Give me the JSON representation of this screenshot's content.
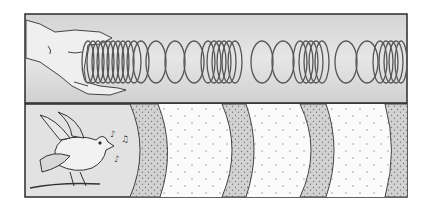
{
  "figure": {
    "panels": [
      {
        "name": "slinky-panel",
        "content": "hand holding slinky spring with alternating compressed and stretched coils"
      },
      {
        "name": "sound-wave-panel",
        "content": "singing bird with musical notes, concentric wave bands of compression and rarefaction"
      }
    ],
    "colors": {
      "outline": "#2b2b2b",
      "panel_shade": "#d9d9d9",
      "compression_band": "#cfcfcf",
      "rarefaction_band": "#fafafa"
    }
  }
}
